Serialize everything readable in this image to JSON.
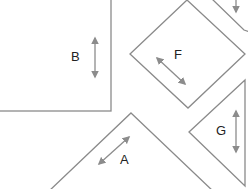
{
  "diagram": {
    "colors": {
      "stroke": "#8a8a8a",
      "arrow": "#8c8c8c",
      "label": "#222222",
      "background": "#ffffff"
    },
    "pieces": [
      {
        "id": "B",
        "label": "B",
        "shape": "rectangle",
        "arrow": "vertical double-headed"
      },
      {
        "id": "F",
        "label": "F",
        "shape": "square rotated 45°",
        "arrow": "diagonal double-headed"
      },
      {
        "id": "A",
        "label": "A",
        "shape": "triangle",
        "arrow": "diagonal double-headed"
      },
      {
        "id": "G",
        "label": "G",
        "shape": "triangle",
        "arrow": "vertical double-headed"
      },
      {
        "id": "partial-top-right",
        "label": "",
        "shape": "triangle (partially visible)",
        "arrow": "vertical arrowhead (partial)"
      }
    ]
  }
}
